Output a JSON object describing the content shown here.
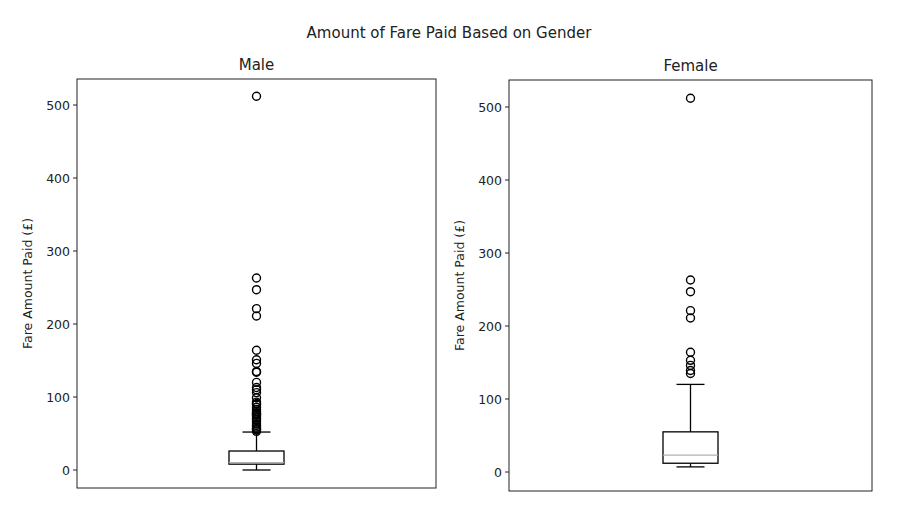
{
  "figure": {
    "title": "Amount of Fare Paid Based on Gender"
  },
  "chart_data": [
    {
      "type": "boxplot",
      "title": "Male",
      "xlabel": "",
      "ylabel": "Fare Amount Paid (£)",
      "ylim": [
        -23,
        538
      ],
      "yticks": [
        0,
        100,
        200,
        300,
        400,
        500
      ],
      "grid": false,
      "stats": {
        "whisker_low": 0,
        "q1": 8,
        "median": 10,
        "q3": 26,
        "whisker_high": 52
      },
      "outliers": [
        512,
        263,
        247,
        221,
        211,
        164,
        151,
        146,
        135,
        134,
        120,
        113,
        110,
        106,
        99,
        93,
        91,
        90,
        86,
        83,
        80,
        78,
        77,
        76,
        75,
        73,
        71,
        69,
        66,
        63,
        61,
        59,
        57,
        56,
        55,
        53
      ]
    },
    {
      "type": "boxplot",
      "title": "Female",
      "xlabel": "",
      "ylabel": "Fare Amount Paid (£)",
      "ylim": [
        -23,
        538
      ],
      "yticks": [
        0,
        100,
        200,
        300,
        400,
        500
      ],
      "grid": false,
      "stats": {
        "whisker_low": 7,
        "q1": 12,
        "median": 23,
        "q3": 55,
        "whisker_high": 120
      },
      "outliers": [
        512,
        263,
        247,
        221,
        211,
        164,
        153,
        146,
        139,
        135
      ]
    }
  ],
  "style": {
    "box_color": "#000000",
    "median_color": "#b0b0b0",
    "axes_color": "#222222"
  }
}
